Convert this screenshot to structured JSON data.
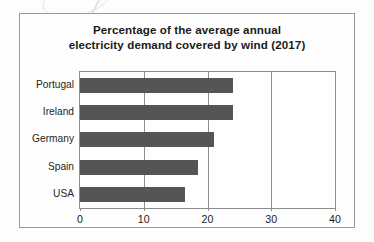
{
  "figure": {
    "title_line1": "Percentage of the average annual",
    "title_line2": "electricity demand covered by wind (2017)",
    "bar_color": "#555555",
    "frame_color": "#9a9a9a",
    "plot_border_color": "#8d8d8d",
    "page_background": "#fdfdfb"
  },
  "chart_data": {
    "type": "bar",
    "orientation": "horizontal",
    "title": "Percentage of the average annual electricity demand covered by wind (2017)",
    "categories": [
      "Portugal",
      "Ireland",
      "Germany",
      "Spain",
      "USA"
    ],
    "values": [
      24,
      24,
      21,
      18.5,
      16.5
    ],
    "series": [
      {
        "name": "Share of average annual electricity demand covered by wind",
        "values": [
          24,
          24,
          21,
          18.5,
          16.5
        ]
      }
    ],
    "xlabel": "",
    "ylabel": "",
    "xlim": [
      0,
      40
    ],
    "ylim": [
      0,
      5
    ],
    "xticks": [
      0,
      10,
      20,
      30,
      40
    ],
    "xtick_labels": [
      "0",
      "10",
      "20",
      "30",
      "40"
    ],
    "gridlines": [
      10,
      20,
      30
    ],
    "grid": true,
    "legend": false,
    "legend_position": "none",
    "units": "percent",
    "year": "2017"
  }
}
